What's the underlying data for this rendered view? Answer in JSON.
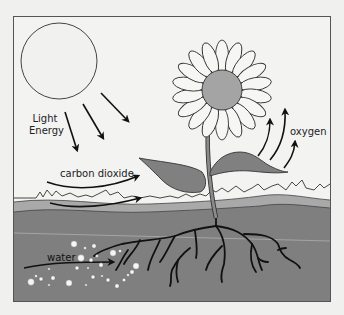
{
  "diagram": {
    "type": "photosynthesis-illustration",
    "colors": {
      "background": "#f0f0ef",
      "frame": "#555555",
      "sky": "#f3f3f2",
      "soil": "#7f7f7f",
      "soil_top_band": "#a9a9a9",
      "sun_fill": "#f1f1f0",
      "flower_center": "#a4a4a4",
      "petal_fill": "#f6f6f5",
      "leaf": "#808080",
      "stem": "#8a8a8a",
      "roots": "#111111",
      "arrows": "#111111",
      "water_bubbles": "#f5f5f5"
    },
    "labels": {
      "light_energy_line1": "Light",
      "light_energy_line2": "Energy",
      "oxygen": "oxygen",
      "carbon_dioxide": "carbon dioxide",
      "water": "water"
    }
  }
}
